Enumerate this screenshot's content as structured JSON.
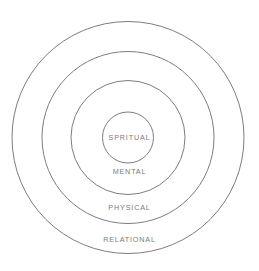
{
  "diagram": {
    "type": "concentric-rings",
    "background_color": "#ffffff",
    "stroke_color": "#7d7d7d",
    "label_color": "#7a7a7a",
    "center": {
      "x": 128,
      "y": 137.5
    },
    "rings": [
      {
        "label": "RELATIONAL",
        "level": 4,
        "position": "outermost",
        "radius": 116,
        "label_y": 241
      },
      {
        "label": "PHYSICAL",
        "level": 3,
        "position": "third",
        "radius": 86,
        "label_y": 209
      },
      {
        "label": "MENTAL",
        "level": 2,
        "position": "second",
        "radius": 57,
        "label_y": 173
      },
      {
        "label": "SPRITUAL",
        "level": 1,
        "position": "innermost",
        "radius": 25.5,
        "label_y": 139
      }
    ]
  }
}
